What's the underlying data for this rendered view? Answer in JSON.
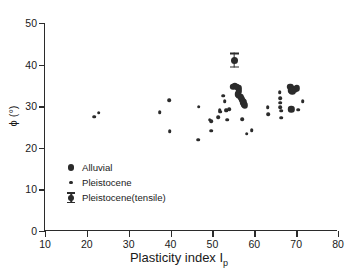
{
  "chart_data": {
    "type": "scatter",
    "title": "",
    "xlabel": "Plasticity index  I",
    "xlabel_sub": "p",
    "ylabel": "ϕ (°)",
    "xlim": [
      10,
      80
    ],
    "ylim": [
      0,
      50
    ],
    "xticks": [
      10,
      20,
      30,
      40,
      50,
      60,
      70,
      80
    ],
    "yticks": [
      0,
      10,
      20,
      30,
      40,
      50
    ],
    "grid": false,
    "legend_position": "lower-left-inside",
    "marker_color": "#2b2b2b",
    "series": [
      {
        "name": "Alluvial",
        "marker": "large-filled-circle",
        "points": [
          [
            55.2,
            34.7
          ],
          [
            55.6,
            34.9
          ],
          [
            56.0,
            34.6
          ],
          [
            56.4,
            34.4
          ],
          [
            56.6,
            34.0
          ],
          [
            56.5,
            33.4
          ],
          [
            56.3,
            32.9
          ],
          [
            56.6,
            32.5
          ],
          [
            57.0,
            32.1
          ],
          [
            57.3,
            31.7
          ],
          [
            57.5,
            31.3
          ],
          [
            57.6,
            30.9
          ],
          [
            57.8,
            30.5
          ],
          [
            58.0,
            30.2
          ],
          [
            68.8,
            34.6
          ],
          [
            69.4,
            34.2
          ],
          [
            69.8,
            33.9
          ],
          [
            70.4,
            34.3
          ],
          [
            68.9,
            33.8
          ],
          [
            69.3,
            33.6
          ],
          [
            69.1,
            29.3
          ]
        ]
      },
      {
        "name": "Pleistocene",
        "marker": "small-filled-circle",
        "points": [
          [
            22.0,
            27.5
          ],
          [
            23.1,
            28.4
          ],
          [
            37.6,
            28.6
          ],
          [
            39.9,
            31.4
          ],
          [
            40.0,
            24.0
          ],
          [
            46.9,
            21.9
          ],
          [
            47.0,
            29.9
          ],
          [
            49.6,
            26.8
          ],
          [
            49.9,
            26.4
          ],
          [
            50.0,
            24.1
          ],
          [
            51.6,
            27.3
          ],
          [
            52.0,
            29.0
          ],
          [
            52.1,
            28.7
          ],
          [
            52.8,
            32.5
          ],
          [
            53.2,
            31.2
          ],
          [
            53.5,
            29.2
          ],
          [
            53.6,
            28.9
          ],
          [
            53.8,
            26.8
          ],
          [
            54.3,
            29.3
          ],
          [
            57.4,
            26.9
          ],
          [
            58.4,
            23.4
          ],
          [
            59.6,
            24.2
          ],
          [
            63.4,
            29.8
          ],
          [
            63.6,
            28.1
          ],
          [
            66.3,
            33.4
          ],
          [
            66.4,
            31.9
          ],
          [
            66.5,
            30.8
          ],
          [
            66.5,
            29.8
          ],
          [
            66.6,
            28.9
          ],
          [
            66.7,
            27.2
          ],
          [
            70.8,
            29.2
          ],
          [
            71.8,
            31.2
          ]
        ]
      },
      {
        "name": "Pleistocene(tensile)",
        "marker": "circle-with-vertical-bar",
        "points": [
          [
            55.4,
            41.0
          ]
        ]
      }
    ]
  },
  "legend": {
    "items": [
      {
        "label": "Alluvial",
        "marker": "large-dot"
      },
      {
        "label": "Pleistocene",
        "marker": "small-dot"
      },
      {
        "label": "Pleistocene(tensile)",
        "marker": "tensile"
      }
    ]
  }
}
